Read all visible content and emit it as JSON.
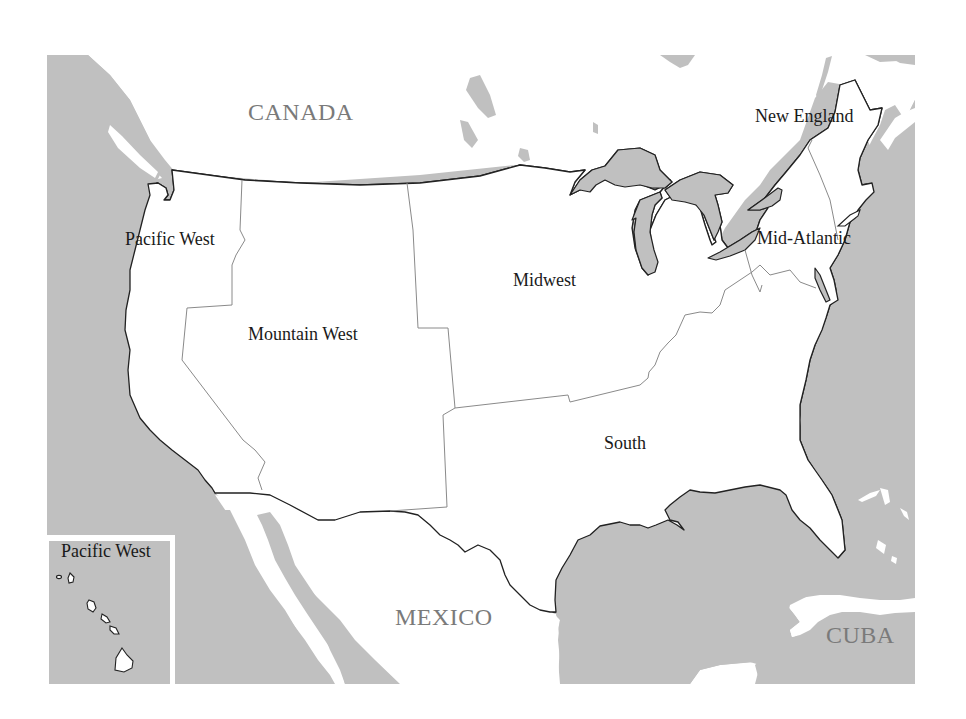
{
  "map": {
    "title": "United States regions",
    "colors": {
      "water": "#c0c0c0",
      "land": "#ffffff",
      "coastline": "#222222",
      "region_border": "#8a8a8a",
      "country_label": "#7a7a7a",
      "region_label": "#1a1a1a"
    },
    "countries": {
      "canada": "CANADA",
      "mexico": "MEXICO",
      "cuba": "CUBA"
    },
    "regions": {
      "pacific_west": "Pacific West",
      "mountain_west": "Mountain West",
      "midwest": "Midwest",
      "south": "South",
      "new_england": "New England",
      "mid_atlantic": "Mid-Atlantic"
    },
    "inset": {
      "label": "Pacific West"
    }
  }
}
